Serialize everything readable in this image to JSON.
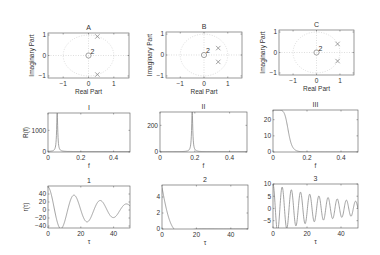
{
  "figure": {
    "width": 380,
    "height": 255,
    "line_color": "#8a8a8a",
    "axis_color": "#555555",
    "text_color": "#333333",
    "grid_color": "#c8c8c8"
  },
  "chart_data": [
    {
      "id": "A",
      "type": "scatter",
      "title": "A",
      "xlabel": "Real Part",
      "ylabel": "Imaginary Part",
      "xlim": [
        -1.6,
        1.6
      ],
      "ylim": [
        -1.1,
        1.1
      ],
      "xticks": [
        -1,
        0,
        1
      ],
      "yticks": [
        -1,
        0,
        1
      ],
      "unit_circle": true,
      "grid": "dotted",
      "zeros": [
        {
          "x": 0,
          "y": 0,
          "multiplicity": 2
        }
      ],
      "poles": [
        {
          "x": 0.35,
          "y": 0.93
        },
        {
          "x": 0.35,
          "y": -0.93
        }
      ],
      "box": [
        48,
        33,
        129,
        78
      ]
    },
    {
      "id": "B",
      "type": "scatter",
      "title": "B",
      "xlabel": "Real Part",
      "ylabel": "Imaginary Part",
      "xlim": [
        -1.6,
        1.6
      ],
      "ylim": [
        -1.1,
        1.1
      ],
      "xticks": [
        -1,
        0,
        1
      ],
      "yticks": [
        -1,
        0,
        1
      ],
      "unit_circle": true,
      "grid": "dotted",
      "zeros": [
        {
          "x": 0,
          "y": 0,
          "multiplicity": 2
        }
      ],
      "poles": [
        {
          "x": 0.6,
          "y": 0.33
        },
        {
          "x": 0.6,
          "y": -0.33
        }
      ],
      "box": [
        166,
        32,
        242,
        78
      ]
    },
    {
      "id": "C",
      "type": "scatter",
      "title": "C",
      "xlabel": "Real Part",
      "ylabel": "Imaginary Part",
      "xlim": [
        -1.6,
        1.6
      ],
      "ylim": [
        -1.1,
        1.1
      ],
      "xticks": [
        -1,
        0,
        1
      ],
      "yticks": [
        -1,
        0,
        1
      ],
      "unit_circle": true,
      "grid": "dotted",
      "zeros": [
        {
          "x": 0,
          "y": 0,
          "multiplicity": 2
        }
      ],
      "poles": [
        {
          "x": 0.9,
          "y": 0.42
        },
        {
          "x": 0.9,
          "y": -0.42
        }
      ],
      "box": [
        279,
        30,
        354,
        75
      ]
    },
    {
      "id": "I",
      "type": "line",
      "title": "I",
      "xlabel": "f",
      "ylabel": "R(f)",
      "xlim": [
        0,
        0.5
      ],
      "ylim": [
        0,
        1800
      ],
      "xticks": [
        0,
        0.2,
        0.4
      ],
      "xticklabels": [
        "0",
        "0.2",
        "0.4"
      ],
      "yticks": [
        0,
        1000
      ],
      "yticklabels": [
        "0",
        "1000"
      ],
      "series": [
        {
          "name": "R(f)",
          "shape": "peak",
          "peak_x": 0.056,
          "peak_y": 1800,
          "width": 0.004,
          "base": 20
        }
      ],
      "box": [
        48,
        113,
        130,
        152
      ]
    },
    {
      "id": "II",
      "type": "line",
      "title": "II",
      "xlabel": "f",
      "ylabel": "",
      "xlim": [
        0,
        0.5
      ],
      "ylim": [
        0,
        300
      ],
      "xticks": [
        0,
        0.2,
        0.4
      ],
      "xticklabels": [
        "0",
        "0.2",
        "0.4"
      ],
      "yticks": [
        0,
        200
      ],
      "yticklabels": [
        "0",
        "200"
      ],
      "series": [
        {
          "name": "R(f)",
          "shape": "peak",
          "peak_x": 0.185,
          "peak_y": 300,
          "width": 0.004,
          "base": 2
        }
      ],
      "box": [
        160,
        112,
        247,
        152
      ]
    },
    {
      "id": "III",
      "type": "line",
      "title": "III",
      "xlabel": "f",
      "ylabel": "",
      "xlim": [
        0,
        0.5
      ],
      "ylim": [
        0,
        26
      ],
      "xticks": [
        0,
        0.2,
        0.4
      ],
      "xticklabels": [
        "0",
        "0.2",
        "0.4"
      ],
      "yticks": [
        0,
        10,
        20
      ],
      "yticklabels": [
        "0",
        "10",
        "20"
      ],
      "series": [
        {
          "name": "R(f)",
          "shape": "lowpass",
          "peak_y": 26,
          "cutoff": 0.09,
          "order": 4
        }
      ],
      "box": [
        273,
        110,
        358,
        152
      ]
    },
    {
      "id": "1",
      "type": "line",
      "title": "1",
      "xlabel": "τ",
      "ylabel": "r(τ)",
      "xlim": [
        0,
        50
      ],
      "ylim": [
        -45,
        60
      ],
      "xticks": [
        0,
        20,
        40
      ],
      "xticklabels": [
        "0",
        "20",
        "40"
      ],
      "yticks": [
        -40,
        -20,
        0,
        20,
        40
      ],
      "yticklabels": [
        "−40",
        "−20",
        "0",
        "20",
        "40"
      ],
      "series": [
        {
          "name": "r(τ)",
          "shape": "damped_cos",
          "amp": 58,
          "period": 16,
          "decay": 0.028
        }
      ],
      "box": [
        48,
        186,
        130,
        228
      ]
    },
    {
      "id": "2",
      "type": "line",
      "title": "2",
      "xlabel": "τ",
      "ylabel": "",
      "xlim": [
        0,
        50
      ],
      "ylim": [
        0,
        5.5
      ],
      "xticks": [
        0,
        20,
        40
      ],
      "xticklabels": [
        "0",
        "20",
        "40"
      ],
      "yticks": [
        0,
        2,
        4
      ],
      "yticklabels": [
        "0",
        "2",
        "4"
      ],
      "series": [
        {
          "name": "r(τ)",
          "shape": "damped_cos",
          "amp": 5.2,
          "period": 28,
          "decay": 0.22,
          "offset": 0.0
        }
      ],
      "box": [
        162,
        185,
        248,
        229
      ]
    },
    {
      "id": "3",
      "type": "line",
      "title": "3",
      "xlabel": "τ",
      "ylabel": "",
      "xlim": [
        0,
        50
      ],
      "ylim": [
        -8,
        10
      ],
      "xticks": [
        0,
        20,
        40
      ],
      "xticklabels": [
        "0",
        "20",
        "40"
      ],
      "yticks": [
        -5,
        0,
        5,
        10
      ],
      "yticklabels": [
        "−5",
        "0",
        "5",
        "10"
      ],
      "series": [
        {
          "name": "r(τ)",
          "shape": "damped_cos",
          "amp": 10,
          "period": 5.4,
          "decay": 0.025
        }
      ],
      "box": [
        273,
        184,
        358,
        228
      ]
    }
  ]
}
